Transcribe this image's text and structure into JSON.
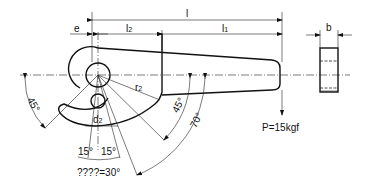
{
  "diagram": {
    "type": "mechanical-drawing",
    "dimensions": {
      "e": "e",
      "l": "l",
      "l1": "l1",
      "l2": "l2",
      "b": "b",
      "r2": "r2",
      "d2": "d2"
    },
    "labels": {
      "e": "e",
      "l": "l",
      "l2_main": "l",
      "l2_sub": "2",
      "l1_main": "l",
      "l1_sub": "1",
      "b": "b",
      "r2_main": "r",
      "r2_sub": "2",
      "d2_main": "d",
      "d2_sub": "2",
      "angle_left": "45°",
      "angle_right_inner": "45°",
      "angle_right_outer": "70°",
      "angle_15_left": "15°",
      "angle_15_right": "15°",
      "angle_total": "????=30°",
      "load": "P=15kgf"
    }
  }
}
